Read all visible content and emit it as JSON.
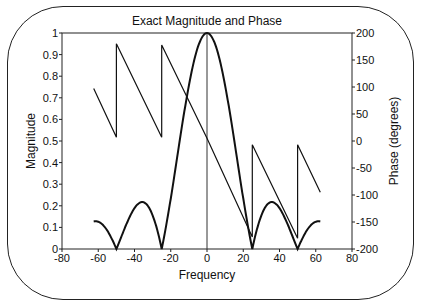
{
  "chart_data": {
    "type": "line",
    "title": "Exact Magnitude and Phase",
    "xlabel": "Frequency",
    "ylabel": "Magnitude",
    "y2label": "Phase (degrees)",
    "xlim": [
      -80,
      80
    ],
    "ylim": [
      0,
      1
    ],
    "y2lim": [
      -200,
      200
    ],
    "xticks": [
      -80,
      -60,
      -40,
      -20,
      0,
      20,
      40,
      60,
      80
    ],
    "yticks": [
      0,
      0.1,
      0.2,
      0.3,
      0.4,
      0.5,
      0.6,
      0.7,
      0.8,
      0.9,
      1
    ],
    "y2ticks": [
      -200,
      -150,
      -100,
      -50,
      0,
      50,
      100,
      150,
      200
    ],
    "grid": false,
    "legend": null,
    "annotations": [
      "vertical line at Frequency = 0"
    ],
    "series": [
      {
        "name": "Magnitude",
        "axis": "left",
        "description": "|sinc(f/25)|, zeros at ±25, ±50",
        "x": [
          -62.5,
          -60,
          -55,
          -50,
          -45,
          -40,
          -36,
          -30,
          -25,
          -20,
          -15,
          -10,
          -5,
          0,
          5,
          10,
          15,
          20,
          25,
          30,
          36,
          40,
          45,
          50,
          55,
          60,
          62.5
        ],
        "values": [
          0.127,
          0.126,
          0.083,
          0.0,
          0.104,
          0.189,
          0.217,
          0.156,
          0.0,
          0.234,
          0.505,
          0.757,
          0.935,
          1.0,
          0.935,
          0.757,
          0.505,
          0.234,
          0.0,
          0.156,
          0.217,
          0.189,
          0.104,
          0.0,
          0.083,
          0.126,
          0.127
        ]
      },
      {
        "name": "Phase",
        "axis": "right",
        "description": "wrapped linear phase with jumps at ±25, ±50",
        "x": [
          -62.5,
          -50,
          -50,
          -25,
          -25,
          0,
          25,
          25,
          50,
          50,
          62.5
        ],
        "values": [
          97,
          7,
          180,
          7,
          178,
          5,
          -178,
          -7,
          -180,
          -7,
          -95
        ]
      }
    ]
  }
}
